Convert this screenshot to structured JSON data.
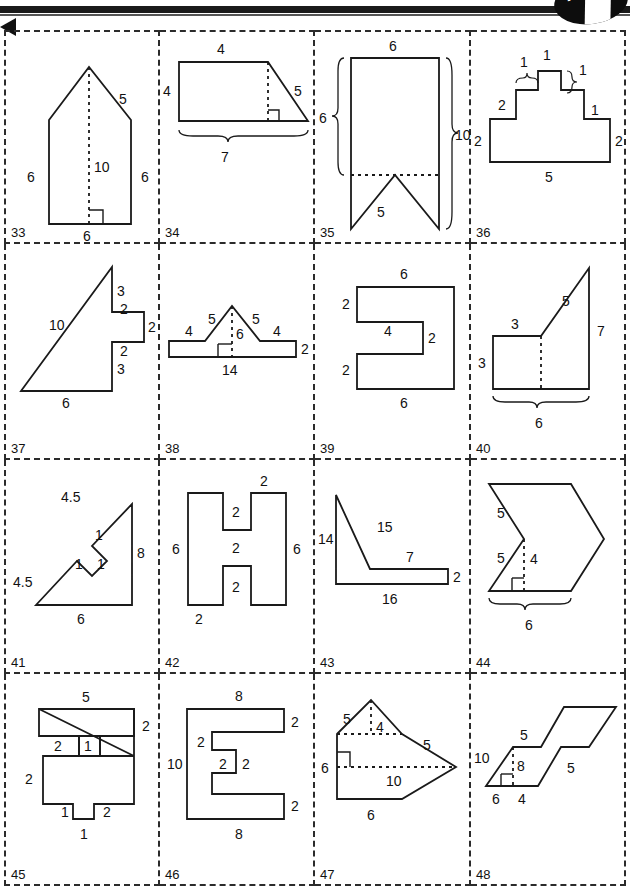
{
  "page": {
    "badge_left": "4",
    "badge_right": "3"
  },
  "problems": [
    {
      "number": "33",
      "shape": "pentagon-house",
      "labels": [
        "5",
        "10",
        "6",
        "6",
        "6"
      ],
      "label_detail": {
        "right_slant": "5",
        "height_dashed": "10",
        "left_side": "6",
        "right_side": "6",
        "base": "6"
      },
      "has_right_angle_mark": true,
      "has_dashed_altitude": true
    },
    {
      "number": "34",
      "shape": "right-trapezoid",
      "labels": [
        "4",
        "4",
        "5",
        "7"
      ],
      "label_detail": {
        "top": "4",
        "left": "4",
        "slant": "5",
        "base_brace": "7"
      },
      "has_right_angle_mark": true,
      "has_dashed_altitude": true,
      "has_brace": true
    },
    {
      "number": "35",
      "shape": "ribbon-banner",
      "labels": [
        "6",
        "6",
        "10",
        "5"
      ],
      "label_detail": {
        "top": "6",
        "left_brace": "6",
        "right_brace": "10",
        "notch_slant": "5"
      },
      "has_dashed_line": true,
      "has_brace": true
    },
    {
      "number": "36",
      "shape": "stepped-pyramid",
      "labels": [
        "1",
        "1",
        "1",
        "2",
        "1",
        "2",
        "2",
        "5"
      ],
      "label_detail": {
        "top": "1",
        "left_step_brace": "1",
        "right_step_brace": "1",
        "left_upper": "2",
        "right_mid": "1",
        "left_lower": "2",
        "right_lower": "2",
        "base": "5"
      },
      "has_brace": true
    },
    {
      "number": "37",
      "shape": "notched-right-triangle",
      "labels": [
        "3",
        "2",
        "10",
        "2",
        "2",
        "3",
        "6"
      ],
      "label_detail": {
        "hypotenuse": "10",
        "upper_right": "3",
        "step_a": "2",
        "step_b": "2",
        "step_c": "2",
        "lower_right": "3",
        "base": "6"
      }
    },
    {
      "number": "38",
      "shape": "tent-on-base",
      "labels": [
        "5",
        "5",
        "4",
        "4",
        "6",
        "2",
        "14"
      ],
      "label_detail": {
        "left_slant": "5",
        "right_slant": "5",
        "left_flat": "4",
        "right_flat": "4",
        "height_dashed": "6",
        "right_side": "2",
        "base": "14"
      },
      "has_right_angle_mark": true,
      "has_dashed_altitude": true
    },
    {
      "number": "39",
      "shape": "c-shape",
      "labels": [
        "6",
        "2",
        "4",
        "2",
        "2",
        "6"
      ],
      "label_detail": {
        "top": "6",
        "upper_left": "2",
        "inner": "4",
        "inner_right": "2",
        "lower_left": "2",
        "bottom": "6"
      }
    },
    {
      "number": "40",
      "shape": "rectangle-with-triangle",
      "labels": [
        "5",
        "3",
        "7",
        "3",
        "6"
      ],
      "label_detail": {
        "slant": "5",
        "top": "3",
        "right": "7",
        "left": "3",
        "base_brace": "6"
      },
      "has_dashed_line": true,
      "has_brace": true
    },
    {
      "number": "41",
      "shape": "triangle-with-square-notch",
      "labels": [
        "4.5",
        "1",
        "1",
        "1",
        "8",
        "4.5",
        "6"
      ],
      "label_detail": {
        "upper_hyp": "4.5",
        "notch_a": "1",
        "notch_b": "1",
        "notch_c": "1",
        "right_side": "8",
        "lower_hyp": "4.5",
        "base": "6"
      }
    },
    {
      "number": "42",
      "shape": "h-shape",
      "labels": [
        "2",
        "2",
        "2",
        "6",
        "6",
        "2",
        "2"
      ],
      "label_detail": {
        "top_right": "2",
        "upper_inner": "2",
        "crossbar": "2",
        "left": "6",
        "right": "6",
        "lower_inner": "2",
        "bottom_left": "2"
      }
    },
    {
      "number": "43",
      "shape": "triangle-with-ledge",
      "labels": [
        "14",
        "15",
        "7",
        "2",
        "16"
      ],
      "label_detail": {
        "left": "14",
        "hypotenuse": "15",
        "ledge_top": "7",
        "ledge_right": "2",
        "base": "16"
      }
    },
    {
      "number": "44",
      "shape": "chevron-arrow",
      "labels": [
        "5",
        "5",
        "4",
        "6"
      ],
      "label_detail": {
        "upper_slant": "5",
        "lower_slant": "5",
        "height_dashed": "4",
        "base_brace": "6"
      },
      "has_right_angle_mark": true,
      "has_dashed_altitude": true,
      "has_brace": true
    },
    {
      "number": "45",
      "shape": "notched-cross",
      "labels": [
        "5",
        "2",
        "2",
        "1",
        "2",
        "1",
        "2",
        "1"
      ],
      "label_detail": {
        "top": "5",
        "upper_right": "2",
        "inner_left": "2",
        "inner_right": "1",
        "left": "2",
        "tab_left": "1",
        "lower_right": "2",
        "tab_bottom": "1"
      }
    },
    {
      "number": "46",
      "shape": "e-shape",
      "labels": [
        "8",
        "2",
        "2",
        "2",
        "2",
        "10",
        "2",
        "8"
      ],
      "label_detail": {
        "top": "8",
        "top_right": "2",
        "inner_upper": "2",
        "inner_mid_a": "2",
        "inner_mid_b": "2",
        "left": "10",
        "bottom_right": "2",
        "bottom": "8"
      }
    },
    {
      "number": "47",
      "shape": "kite-arrow",
      "labels": [
        "5",
        "4",
        "5",
        "6",
        "10",
        "6"
      ],
      "label_detail": {
        "upper_left_slant": "5",
        "apex_height": "4",
        "right_slant": "5",
        "left_side": "6",
        "width_dashed": "10",
        "base": "6"
      },
      "has_right_angle_mark": true,
      "has_dashed_altitude": true
    },
    {
      "number": "48",
      "shape": "stepped-parallelogram",
      "labels": [
        "5",
        "5",
        "10",
        "8",
        "6",
        "4"
      ],
      "label_detail": {
        "upper_step": "5",
        "lower_step": "5",
        "left_slant": "10",
        "height_dashed": "8",
        "base_a": "6",
        "base_b": "4"
      },
      "has_right_angle_mark": true,
      "has_dashed_altitude": true
    }
  ]
}
